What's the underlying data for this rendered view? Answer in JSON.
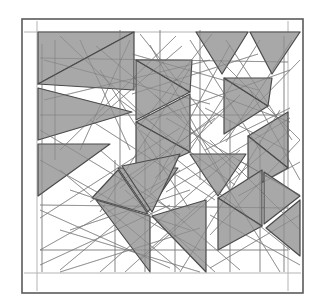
{
  "figure": {
    "type": "geometric-line-art",
    "width": 326,
    "height": 307,
    "background_color": "#ffffff",
    "canvas_color": "#ffffff"
  },
  "frame": {
    "outer": {
      "x": 22,
      "y": 19,
      "width": 281,
      "height": 274,
      "stroke_color": "#5a5a5a",
      "stroke_width": 1.6,
      "fill": "#ffffff"
    },
    "inner_guides": {
      "stroke_color": "#b4b4b4",
      "stroke_width": 1.0,
      "left_x": 37,
      "right_x": 288,
      "top_y": 32,
      "bottom_y": 273
    }
  },
  "style": {
    "triangle_fill": "#a8a8a8",
    "triangle_stroke": "#4a4a4a",
    "triangle_stroke_width": 1.2,
    "construction_line_color": "#9a9a9a",
    "construction_line_width": 0.75,
    "inner_edge_color": "#6a6a6a",
    "inner_edge_width": 0.9
  },
  "shapes": {
    "filled_triangles": [
      [
        [
          38,
          32
        ],
        [
          134,
          32
        ],
        [
          38,
          84
        ]
      ],
      [
        [
          38,
          88
        ],
        [
          132,
          112
        ],
        [
          38,
          140
        ]
      ],
      [
        [
          38,
          144
        ],
        [
          110,
          144
        ],
        [
          38,
          196
        ]
      ],
      [
        [
          134,
          32
        ],
        [
          134,
          90
        ],
        [
          38,
          84
        ]
      ],
      [
        [
          136,
          60
        ],
        [
          190,
          92
        ],
        [
          136,
          120
        ]
      ],
      [
        [
          136,
          60
        ],
        [
          190,
          92
        ],
        [
          192,
          60
        ]
      ],
      [
        [
          136,
          122
        ],
        [
          190,
          94
        ],
        [
          190,
          152
        ]
      ],
      [
        [
          136,
          122
        ],
        [
          190,
          152
        ],
        [
          136,
          176
        ]
      ],
      [
        [
          196,
          32
        ],
        [
          248,
          32
        ],
        [
          222,
          74
        ]
      ],
      [
        [
          250,
          32
        ],
        [
          300,
          32
        ],
        [
          272,
          74
        ]
      ],
      [
        [
          224,
          78
        ],
        [
          268,
          106
        ],
        [
          224,
          134
        ]
      ],
      [
        [
          268,
          106
        ],
        [
          224,
          78
        ],
        [
          272,
          78
        ]
      ],
      [
        [
          248,
          136
        ],
        [
          288,
          112
        ],
        [
          288,
          168
        ]
      ],
      [
        [
          248,
          136
        ],
        [
          288,
          168
        ],
        [
          248,
          190
        ]
      ],
      [
        [
          118,
          168
        ],
        [
          178,
          168
        ],
        [
          148,
          212
        ]
      ],
      [
        [
          118,
          170
        ],
        [
          148,
          214
        ],
        [
          92,
          198
        ]
      ],
      [
        [
          96,
          200
        ],
        [
          150,
          216
        ],
        [
          150,
          272
        ]
      ],
      [
        [
          152,
          216
        ],
        [
          206,
          200
        ],
        [
          206,
          272
        ]
      ],
      [
        [
          190,
          154
        ],
        [
          246,
          154
        ],
        [
          218,
          196
        ]
      ],
      [
        [
          218,
          198
        ],
        [
          262,
          170
        ],
        [
          262,
          226
        ]
      ],
      [
        [
          218,
          198
        ],
        [
          262,
          226
        ],
        [
          218,
          250
        ]
      ],
      [
        [
          264,
          172
        ],
        [
          300,
          196
        ],
        [
          264,
          224
        ]
      ],
      [
        [
          266,
          228
        ],
        [
          300,
          200
        ],
        [
          300,
          256
        ]
      ],
      [
        [
          180,
          154
        ],
        [
          152,
          212
        ],
        [
          122,
          166
        ]
      ]
    ],
    "construction_lines": [
      [
        [
          60,
          36
        ],
        [
          176,
          146
        ]
      ],
      [
        [
          176,
          36
        ],
        [
          60,
          150
        ]
      ],
      [
        [
          140,
          34
        ],
        [
          212,
          124
        ]
      ],
      [
        [
          212,
          34
        ],
        [
          138,
          128
        ]
      ],
      [
        [
          96,
          46
        ],
        [
          182,
          118
        ]
      ],
      [
        [
          182,
          46
        ],
        [
          96,
          120
        ]
      ],
      [
        [
          132,
          54
        ],
        [
          258,
          90
        ]
      ],
      [
        [
          258,
          54
        ],
        [
          132,
          94
        ]
      ],
      [
        [
          44,
          100
        ],
        [
          210,
          60
        ]
      ],
      [
        [
          44,
          60
        ],
        [
          210,
          104
        ]
      ],
      [
        [
          160,
          30
        ],
        [
          160,
          180
        ]
      ],
      [
        [
          200,
          30
        ],
        [
          200,
          180
        ]
      ],
      [
        [
          120,
          30
        ],
        [
          120,
          170
        ]
      ],
      [
        [
          150,
          120
        ],
        [
          290,
          70
        ]
      ],
      [
        [
          150,
          70
        ],
        [
          290,
          122
        ]
      ],
      [
        [
          220,
          60
        ],
        [
          300,
          140
        ]
      ],
      [
        [
          300,
          60
        ],
        [
          220,
          142
        ]
      ],
      [
        [
          226,
          40
        ],
        [
          292,
          140
        ]
      ],
      [
        [
          292,
          40
        ],
        [
          226,
          142
        ]
      ],
      [
        [
          250,
          90
        ],
        [
          300,
          180
        ]
      ],
      [
        [
          40,
          160
        ],
        [
          200,
          250
        ]
      ],
      [
        [
          200,
          160
        ],
        [
          40,
          250
        ]
      ],
      [
        [
          60,
          170
        ],
        [
          180,
          270
        ]
      ],
      [
        [
          180,
          170
        ],
        [
          60,
          270
        ]
      ],
      [
        [
          70,
          190
        ],
        [
          190,
          230
        ]
      ],
      [
        [
          190,
          190
        ],
        [
          70,
          230
        ]
      ],
      [
        [
          100,
          150
        ],
        [
          240,
          270
        ]
      ],
      [
        [
          240,
          150
        ],
        [
          100,
          272
        ]
      ],
      [
        [
          140,
          130
        ],
        [
          290,
          250
        ]
      ],
      [
        [
          290,
          130
        ],
        [
          140,
          260
        ]
      ],
      [
        [
          180,
          110
        ],
        [
          280,
          272
        ]
      ],
      [
        [
          280,
          110
        ],
        [
          180,
          272
        ]
      ],
      [
        [
          210,
          140
        ],
        [
          300,
          230
        ]
      ],
      [
        [
          300,
          140
        ],
        [
          210,
          235
        ]
      ],
      [
        [
          40,
          210
        ],
        [
          170,
          268
        ]
      ],
      [
        [
          170,
          205
        ],
        [
          40,
          265
        ]
      ],
      [
        [
          115,
          160
        ],
        [
          115,
          272
        ]
      ],
      [
        [
          145,
          140
        ],
        [
          145,
          272
        ]
      ],
      [
        [
          175,
          150
        ],
        [
          175,
          272
        ]
      ],
      [
        [
          230,
          120
        ],
        [
          230,
          272
        ]
      ],
      [
        [
          260,
          140
        ],
        [
          260,
          272
        ]
      ],
      [
        [
          55,
          40
        ],
        [
          55,
          160
        ]
      ],
      [
        [
          80,
          40
        ],
        [
          130,
          150
        ]
      ],
      [
        [
          130,
          40
        ],
        [
          80,
          150
        ]
      ],
      [
        [
          190,
          40
        ],
        [
          260,
          150
        ]
      ],
      [
        [
          260,
          40
        ],
        [
          190,
          150
        ]
      ],
      [
        [
          155,
          95
        ],
        [
          240,
          175
        ]
      ],
      [
        [
          240,
          95
        ],
        [
          155,
          178
        ]
      ],
      [
        [
          120,
          100
        ],
        [
          235,
          185
        ]
      ],
      [
        [
          235,
          100
        ],
        [
          120,
          188
        ]
      ],
      [
        [
          90,
          120
        ],
        [
          215,
          200
        ]
      ],
      [
        [
          215,
          118
        ],
        [
          90,
          202
        ]
      ],
      [
        [
          40,
          130
        ],
        [
          180,
          215
        ]
      ],
      [
        [
          180,
          128
        ],
        [
          40,
          218
        ]
      ],
      [
        [
          150,
          45
        ],
        [
          230,
          190
        ]
      ],
      [
        [
          230,
          45
        ],
        [
          150,
          192
        ]
      ],
      [
        [
          100,
          70
        ],
        [
          190,
          210
        ]
      ],
      [
        [
          190,
          68
        ],
        [
          100,
          212
        ]
      ],
      [
        [
          205,
          150
        ],
        [
          290,
          108
        ]
      ],
      [
        [
          205,
          108
        ],
        [
          290,
          152
        ]
      ],
      [
        [
          238,
          160
        ],
        [
          300,
          195
        ]
      ],
      [
        [
          238,
          196
        ],
        [
          300,
          162
        ]
      ],
      [
        [
          210,
          215
        ],
        [
          300,
          265
        ]
      ],
      [
        [
          300,
          215
        ],
        [
          210,
          268
        ]
      ],
      [
        [
          60,
          230
        ],
        [
          200,
          272
        ]
      ],
      [
        [
          200,
          228
        ],
        [
          60,
          272
        ]
      ],
      [
        [
          42,
          44
        ],
        [
          42,
          272
        ]
      ],
      [
        [
          284,
          36
        ],
        [
          284,
          272
        ]
      ],
      [
        [
          40,
          250
        ],
        [
          288,
          250
        ]
      ],
      [
        [
          40,
          115
        ],
        [
          288,
          115
        ]
      ],
      [
        [
          40,
          205
        ],
        [
          288,
          208
        ]
      ],
      [
        [
          40,
          58
        ],
        [
          288,
          62
        ]
      ],
      [
        [
          125,
          190
        ],
        [
          215,
          272
        ]
      ],
      [
        [
          215,
          190
        ],
        [
          125,
          272
        ]
      ],
      [
        [
          166,
          118
        ],
        [
          290,
          190
        ]
      ],
      [
        [
          290,
          118
        ],
        [
          166,
          192
        ]
      ]
    ]
  },
  "labels": {
    "alt_text": "Abstract geometric figure: gray triangles arranged in a tiling pattern with overlapping thin construction lines inside a rectangular double frame."
  }
}
